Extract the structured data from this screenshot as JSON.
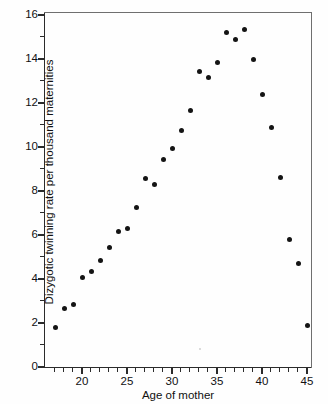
{
  "chart_data": {
    "type": "scatter",
    "title": "",
    "xlabel": "Age of mother",
    "ylabel": "Dizygotic twinning rate per thousand maternities",
    "xlim": [
      16,
      45.6
    ],
    "ylim": [
      0,
      16
    ],
    "grid": false,
    "legend": null,
    "x_ticks": [
      20,
      25,
      30,
      35,
      40,
      45
    ],
    "x_minor_step": 1,
    "y_ticks": [
      0,
      2,
      4,
      6,
      8,
      10,
      12,
      14,
      16
    ],
    "y_minor_step": 1,
    "x_tick_labels": [
      "20",
      "25",
      "30",
      "35",
      "40",
      "45"
    ],
    "y_tick_labels": [
      "0",
      "2",
      "4",
      "6",
      "8",
      "10",
      "12",
      "14",
      "16"
    ],
    "marker": "filled-circle",
    "marker_color": "#141414",
    "x": [
      17,
      18,
      19,
      20,
      21,
      22,
      23,
      24,
      25,
      26,
      27,
      28,
      29,
      30,
      31,
      32,
      33,
      34,
      35,
      36,
      37,
      38,
      39,
      40,
      41,
      42,
      43,
      44,
      45
    ],
    "values": [
      1.8,
      2.65,
      2.85,
      4.05,
      4.35,
      4.85,
      5.45,
      6.15,
      6.3,
      7.25,
      8.55,
      8.3,
      9.45,
      9.95,
      10.75,
      11.65,
      13.45,
      13.15,
      13.85,
      15.2,
      14.9,
      15.35,
      14.0,
      12.4,
      10.9,
      8.6,
      5.8,
      4.7,
      1.9
    ],
    "points": [
      {
        "x": 17,
        "y": 1.8
      },
      {
        "x": 18,
        "y": 2.65
      },
      {
        "x": 19,
        "y": 2.85
      },
      {
        "x": 20,
        "y": 4.05
      },
      {
        "x": 21,
        "y": 4.35
      },
      {
        "x": 22,
        "y": 4.85
      },
      {
        "x": 23,
        "y": 5.45
      },
      {
        "x": 24,
        "y": 6.15
      },
      {
        "x": 25,
        "y": 6.3
      },
      {
        "x": 26,
        "y": 7.25
      },
      {
        "x": 27,
        "y": 8.55
      },
      {
        "x": 28,
        "y": 8.3
      },
      {
        "x": 29,
        "y": 9.45
      },
      {
        "x": 30,
        "y": 9.95
      },
      {
        "x": 31,
        "y": 10.75
      },
      {
        "x": 32,
        "y": 11.65
      },
      {
        "x": 33,
        "y": 13.45
      },
      {
        "x": 34,
        "y": 13.15
      },
      {
        "x": 35,
        "y": 13.85
      },
      {
        "x": 36,
        "y": 15.2
      },
      {
        "x": 37,
        "y": 14.9
      },
      {
        "x": 38,
        "y": 15.35
      },
      {
        "x": 39,
        "y": 14.0
      },
      {
        "x": 40,
        "y": 12.4
      },
      {
        "x": 41,
        "y": 10.9
      },
      {
        "x": 42,
        "y": 8.6
      },
      {
        "x": 43,
        "y": 5.8
      },
      {
        "x": 44,
        "y": 4.7
      },
      {
        "x": 45,
        "y": 1.9
      }
    ]
  },
  "axes": {
    "x_title": "Age of mother",
    "y_title": "Dizygotic twinning rate per thousand maternities"
  }
}
